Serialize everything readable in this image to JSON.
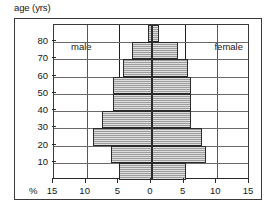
{
  "chart_data": {
    "type": "bar",
    "subtype": "population-pyramid",
    "title": "",
    "ylabel": "age (yrs)",
    "xlabel": "%",
    "xunit": "%",
    "grid": true,
    "legend_position": "in-plot-top-corners",
    "axis_title": "age (yrs)",
    "percent_symbol": "%",
    "xlim": [
      -15,
      15
    ],
    "ylim": [
      0,
      90
    ],
    "x_tick_labels": [
      "15",
      "10",
      "5",
      "0",
      "5",
      "10",
      "15"
    ],
    "x_tick_values": [
      -15,
      -10,
      -5,
      0,
      5,
      10,
      15
    ],
    "y_tick_labels": [
      "10",
      "20",
      "30",
      "40",
      "50",
      "60",
      "70",
      "80"
    ],
    "y_tick_values": [
      10,
      20,
      30,
      40,
      50,
      60,
      70,
      80
    ],
    "categories": [
      "0-10",
      "10-20",
      "20-30",
      "30-40",
      "40-50",
      "50-60",
      "60-70",
      "70-80",
      "80+"
    ],
    "series": [
      {
        "name": "male",
        "side": "left",
        "values": [
          5.0,
          6.2,
          9.0,
          7.7,
          6.0,
          6.0,
          4.5,
          3.0,
          0.6
        ]
      },
      {
        "name": "female",
        "side": "right",
        "values": [
          5.2,
          8.2,
          7.7,
          6.0,
          6.0,
          6.0,
          5.5,
          4.0,
          1.1
        ]
      }
    ],
    "colors": {
      "bar_fill": "#b9b9b9",
      "bar_edge": "#2b2b2b",
      "grid": "#6a6a6a",
      "axis": "#2b2b2b",
      "frame": "#3a3a3a",
      "background": "#ffffff",
      "text": "#161616"
    }
  },
  "labels": {
    "male": "male",
    "female": "female"
  }
}
